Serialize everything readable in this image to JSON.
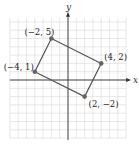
{
  "chart_data": {
    "type": "scatter",
    "title": "",
    "xlabel": "x",
    "ylabel": "y",
    "xlim": [
      -7,
      7
    ],
    "ylim": [
      -7,
      7
    ],
    "grid": true,
    "shape": "rectangle",
    "points": [
      {
        "x": -2,
        "y": 5,
        "label": "(−2, 5)"
      },
      {
        "x": 4,
        "y": 2,
        "label": "(4, 2)"
      },
      {
        "x": 2,
        "y": -2,
        "label": "(2, −2)"
      },
      {
        "x": -4,
        "y": 1,
        "label": "(−4, 1)"
      }
    ]
  },
  "axes": {
    "x_label": "x",
    "y_label": "y"
  },
  "colors": {
    "grid": "#d9d9d9",
    "axis": "#333333",
    "polygon": "#555555",
    "point": "#666666"
  }
}
